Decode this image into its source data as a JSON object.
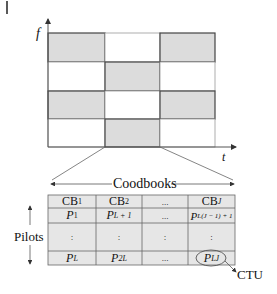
{
  "figure": {
    "marker": "|",
    "y_axis_label": "f",
    "x_axis_label": "t",
    "grid": {
      "rows": 4,
      "cols": 3,
      "shaded_cells": [
        [
          0,
          0
        ],
        [
          0,
          2
        ],
        [
          1,
          1
        ],
        [
          2,
          0
        ],
        [
          2,
          2
        ],
        [
          3,
          1
        ]
      ],
      "shade_color": "#dcdcdc",
      "line_color": "#555555"
    }
  },
  "table": {
    "header_label": "Coodbooks",
    "side_label": "Pilots",
    "columns": [
      {
        "base": "CB",
        "sub": "1"
      },
      {
        "base": "CB",
        "sub": "2"
      },
      {
        "base": "...",
        "sub": ""
      },
      {
        "base": "CB",
        "sub": "J"
      }
    ],
    "first_row": [
      {
        "base": "P",
        "sub": "1"
      },
      {
        "base": "P",
        "sub": "L + 1"
      },
      {
        "base": "...",
        "sub": ""
      },
      {
        "base": "P",
        "sub": "L(J − 1) + 1"
      }
    ],
    "dots_row": [
      ":",
      ":",
      ":",
      ":"
    ],
    "last_row": [
      {
        "base": "P",
        "sub": "L"
      },
      {
        "base": "P",
        "sub": "2L"
      },
      {
        "base": "...",
        "sub": ""
      },
      {
        "base": "P",
        "sub": "LJ"
      }
    ],
    "cell_color": "#e6e6e6",
    "callout_label": "CTU"
  }
}
